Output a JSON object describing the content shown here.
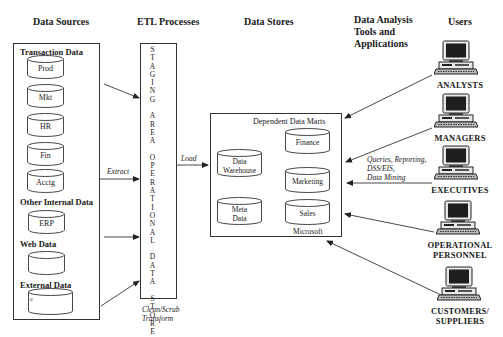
{
  "headers": {
    "data_sources": "Data Sources",
    "etl_processes": "ETL Processes",
    "data_stores": "Data Stores",
    "analysis_tools": [
      "Data Analysis",
      "Tools and",
      "Applications"
    ],
    "users": "Users"
  },
  "data_sources": {
    "transaction_label": "Transaction Data",
    "transaction_items": [
      "Prod",
      "Mkt",
      "HR",
      "Fin",
      "Acctg"
    ],
    "other_internal_label": "Other Internal Data",
    "other_internal_items": [
      "ERP"
    ],
    "web_label": "Web Data",
    "web_items": [
      ""
    ],
    "external_label": "External Data",
    "external_items": [
      "c"
    ]
  },
  "etl": {
    "staging_letters": [
      "S",
      "T",
      "A",
      "G",
      "I",
      "N",
      "G",
      "",
      "A",
      "R",
      "E",
      "A",
      "",
      "O",
      "P",
      "E",
      "R",
      "A",
      "T",
      "I",
      "O",
      "N",
      "A",
      "L",
      "",
      "D",
      "A",
      "T",
      "A",
      "",
      "S",
      "T",
      "O",
      "R",
      "E"
    ],
    "extract_label": "Extract",
    "load_label": "Load",
    "transform_label": [
      "Clean/Scrub",
      "Transform"
    ]
  },
  "data_stores": {
    "marts_label": "Dependent Data Marts",
    "warehouse": [
      "Data",
      "Warehouse"
    ],
    "meta": [
      "Meta",
      "Data"
    ],
    "marts": [
      "Finance",
      "Marketing",
      "Sales"
    ],
    "vendor_label": "Microsoft"
  },
  "analysis": {
    "tools_label": [
      "Queries, Reporting,",
      "DSS/EIS,",
      "Data Mining"
    ]
  },
  "users": [
    {
      "label": [
        "ANALYSTS"
      ]
    },
    {
      "label": [
        "MANAGERS"
      ]
    },
    {
      "label": [
        "EXECUTIVES"
      ]
    },
    {
      "label": [
        "OPERATIONAL",
        "PERSONNEL"
      ]
    },
    {
      "label": [
        "CUSTOMERS/",
        "SUPPLIERS"
      ]
    }
  ],
  "colors": {
    "line": "#333333",
    "text": "#1a1a1a",
    "pc_body": "#e8e8e8",
    "pc_screen": "#1e1e1e"
  }
}
